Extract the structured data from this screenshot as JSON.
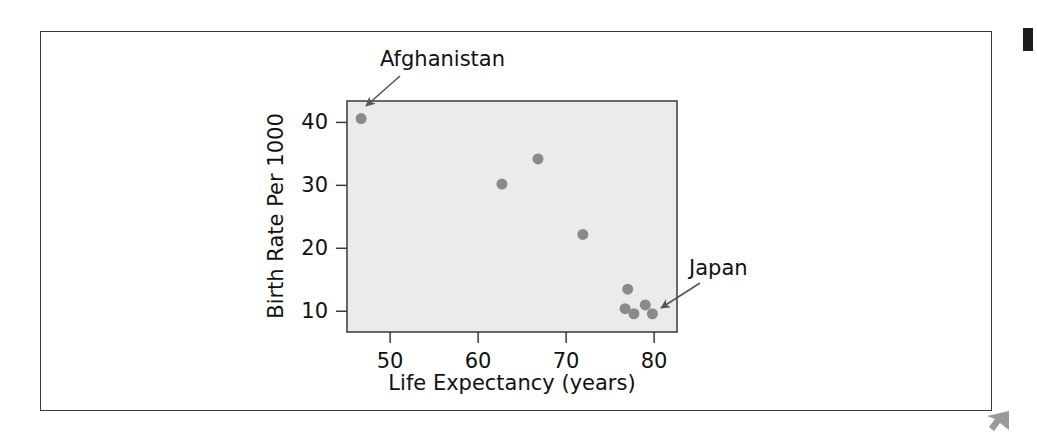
{
  "figure": {
    "background_color": "#ffffff",
    "frame_color": "#3a3a3a",
    "corner_mark_color": "#1d1d1d",
    "cursor_mark_color": "#9a9a9a"
  },
  "chart_data": {
    "type": "scatter",
    "title": "",
    "xlabel": "Life Expectancy (years)",
    "ylabel": "Birth Rate Per 1000",
    "xlim": [
      45.1,
      82.6
    ],
    "ylim": [
      6.7,
      43.4
    ],
    "xticks": [
      50,
      60,
      70,
      80
    ],
    "xtick_labels": [
      "50",
      "60",
      "70",
      "80"
    ],
    "yticks": [
      10,
      20,
      30,
      40
    ],
    "ytick_labels": [
      "10",
      "20",
      "30",
      "40"
    ],
    "grid": false,
    "legend": null,
    "plot_background": "#ebebeb",
    "marker_color": "#8a8a8a",
    "marker_size": 11,
    "points": [
      {
        "x": 46.7,
        "y": 40.6,
        "label": "Afghanistan"
      },
      {
        "x": 62.7,
        "y": 30.2,
        "label": ""
      },
      {
        "x": 66.8,
        "y": 34.2,
        "label": ""
      },
      {
        "x": 71.9,
        "y": 22.2,
        "label": ""
      },
      {
        "x": 77.0,
        "y": 13.5,
        "label": ""
      },
      {
        "x": 76.7,
        "y": 10.4,
        "label": ""
      },
      {
        "x": 77.7,
        "y": 9.6,
        "label": ""
      },
      {
        "x": 79.0,
        "y": 11.0,
        "label": ""
      },
      {
        "x": 79.8,
        "y": 9.6,
        "label": "Japan"
      }
    ],
    "annotations": [
      {
        "text": "Afghanistan",
        "text_x": 380,
        "text_y": 66,
        "arrow_from_x": 400,
        "arrow_from_y": 76,
        "arrow_to_x": 366,
        "arrow_to_y": 106
      },
      {
        "text": "Japan",
        "text_x": 689,
        "text_y": 275,
        "arrow_from_x": 700,
        "arrow_from_y": 283,
        "arrow_to_x": 661,
        "arrow_to_y": 308
      }
    ]
  }
}
